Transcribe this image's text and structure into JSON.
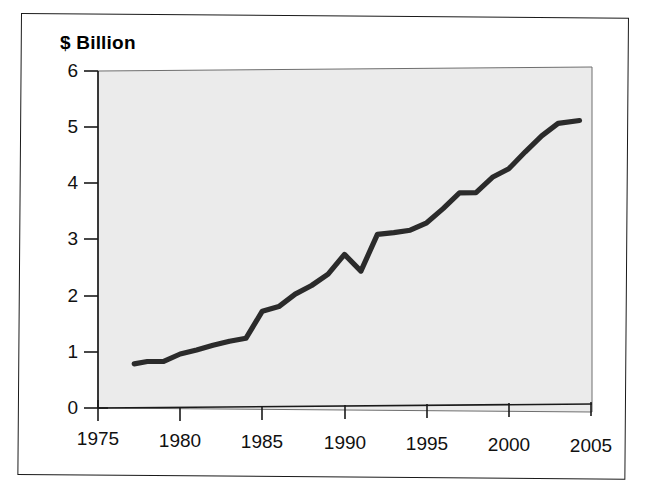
{
  "figure": {
    "title": "$ Billion",
    "frame_color": "#1a1a1a",
    "plot_background": "#ebebeb",
    "line_color": "#2b2b2b",
    "axis_color": "#1a1a1a"
  },
  "chart_data": {
    "type": "line",
    "title": "$ Billion",
    "xlabel": "",
    "ylabel": "$ Billion",
    "xlim": [
      1975,
      2005
    ],
    "ylim": [
      0,
      6
    ],
    "xticks": [
      1975,
      1980,
      1985,
      1990,
      1995,
      2000,
      2005
    ],
    "yticks": [
      0,
      1,
      2,
      3,
      4,
      5,
      6
    ],
    "grid": false,
    "legend": null,
    "series": [
      {
        "name": "Value",
        "x": [
          1977.2,
          1978,
          1979,
          1980,
          1981,
          1982,
          1983,
          1984,
          1985,
          1986,
          1987,
          1988,
          1989,
          1990,
          1991,
          1992,
          1993,
          1994,
          1995,
          1996,
          1997,
          1998,
          1999,
          2000,
          2001,
          2002,
          2003,
          2004.3
        ],
        "values": [
          0.78,
          0.82,
          0.82,
          0.95,
          1.02,
          1.1,
          1.17,
          1.22,
          1.7,
          1.78,
          2.0,
          2.15,
          2.35,
          2.7,
          2.4,
          3.05,
          3.08,
          3.12,
          3.25,
          3.5,
          3.78,
          3.78,
          4.05,
          4.2,
          4.5,
          4.78,
          5.0,
          5.05
        ]
      }
    ]
  },
  "axes": {
    "y_tick_labels": [
      "6",
      "5",
      "4",
      "3",
      "2",
      "1",
      "0"
    ],
    "x_tick_labels": [
      "1975",
      "1980",
      "1985",
      "1990",
      "1995",
      "2000",
      "2005"
    ]
  }
}
